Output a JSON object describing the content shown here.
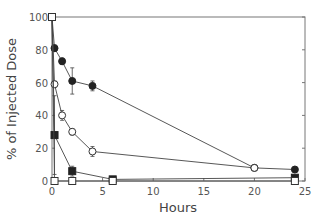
{
  "chart_data": {
    "type": "line",
    "title": "",
    "xlabel": "Hours",
    "ylabel": "% of Injected Dose",
    "xlim": [
      0,
      25
    ],
    "ylim": [
      0,
      100
    ],
    "xticks": [
      0,
      5,
      10,
      15,
      20,
      25
    ],
    "yticks": [
      0,
      20,
      40,
      60,
      80,
      100
    ],
    "grid": false,
    "legend": null,
    "series": [
      {
        "name": "filled-circles",
        "marker": "circle-filled",
        "points": [
          [
            0,
            100
          ],
          [
            0.25,
            81
          ],
          [
            1,
            73
          ],
          [
            2,
            61
          ],
          [
            4,
            58
          ],
          [
            20,
            8
          ],
          [
            24,
            7
          ]
        ],
        "errors": [
          0,
          2,
          2,
          8,
          3,
          1,
          1
        ]
      },
      {
        "name": "open-circles",
        "marker": "circle-open",
        "points": [
          [
            0,
            100
          ],
          [
            0.25,
            59
          ],
          [
            1,
            40
          ],
          [
            2,
            30
          ],
          [
            4,
            18
          ],
          [
            20,
            8
          ]
        ],
        "errors": [
          0,
          2,
          3,
          2,
          3,
          1
        ]
      },
      {
        "name": "filled-squares",
        "marker": "square-filled",
        "points": [
          [
            0,
            100
          ],
          [
            0.25,
            28
          ],
          [
            2,
            6
          ],
          [
            6,
            1
          ],
          [
            24,
            2
          ]
        ],
        "errors": [
          0,
          24,
          3,
          1,
          1
        ]
      },
      {
        "name": "open-squares",
        "marker": "square-open",
        "points": [
          [
            0,
            100
          ],
          [
            0.25,
            0
          ],
          [
            2,
            0
          ],
          [
            6,
            0
          ],
          [
            24,
            0
          ]
        ],
        "errors": [
          0,
          0,
          0,
          0,
          0
        ]
      }
    ]
  }
}
